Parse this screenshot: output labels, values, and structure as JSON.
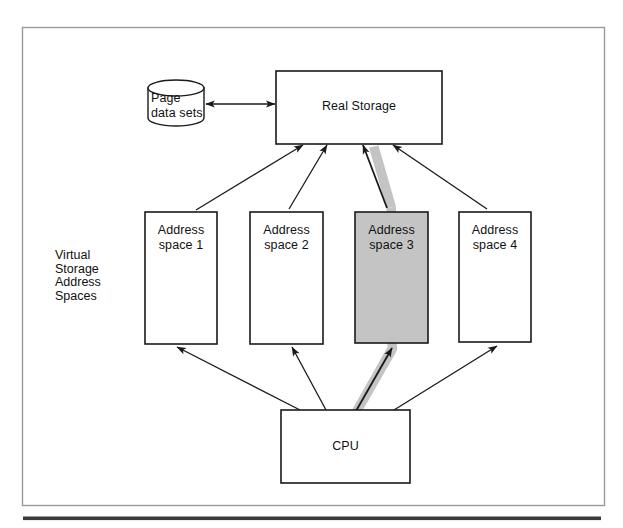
{
  "figure": {
    "kind": "architecture-diagram"
  },
  "colors": {
    "stroke": "#1a1a1a",
    "frame": "#9a9a9a",
    "rule": "#3a3a3a",
    "shaded_fill": "#c4c4c4",
    "highlight_band": "#c4c4c4",
    "box_fill": "#ffffff",
    "page": "#ffffff"
  },
  "nodes": {
    "page_data_sets": {
      "label": "Page\ndata sets",
      "shape": "cylinder"
    },
    "real_storage": {
      "label": "Real Storage",
      "shape": "rectangle"
    },
    "cpu": {
      "label": "CPU",
      "shape": "rectangle"
    },
    "address_spaces": [
      {
        "label": "Address\nspace 1",
        "shaded": false
      },
      {
        "label": "Address\nspace 2",
        "shaded": false
      },
      {
        "label": "Address\nspace 3",
        "shaded": true
      },
      {
        "label": "Address\nspace 4",
        "shaded": false
      }
    ]
  },
  "group_label": {
    "text": "Virtual\nStorage\nAddress\nSpaces"
  },
  "connectors": [
    {
      "name": "page-data-sets-to-real-storage",
      "arrowheads": "both",
      "highlighted": false
    },
    {
      "name": "address-space-1-to-real-storage",
      "arrowheads": "end",
      "highlighted": false
    },
    {
      "name": "address-space-2-to-real-storage",
      "arrowheads": "end",
      "highlighted": false
    },
    {
      "name": "address-space-3-to-real-storage",
      "arrowheads": "end",
      "highlighted": true
    },
    {
      "name": "address-space-4-to-real-storage",
      "arrowheads": "end",
      "highlighted": false
    },
    {
      "name": "cpu-to-address-space-1",
      "arrowheads": "end",
      "highlighted": false
    },
    {
      "name": "cpu-to-address-space-2",
      "arrowheads": "end",
      "highlighted": false
    },
    {
      "name": "cpu-to-address-space-3",
      "arrowheads": "end",
      "highlighted": true
    },
    {
      "name": "cpu-to-address-space-4",
      "arrowheads": "end",
      "highlighted": false
    }
  ]
}
